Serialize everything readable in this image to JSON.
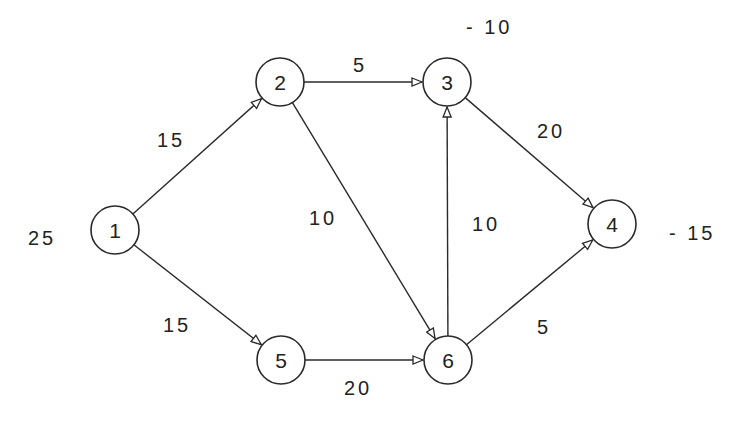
{
  "diagram": {
    "type": "directed-network-flow",
    "stroke_color": "#2a2a2a",
    "background": "#ffffff",
    "nodes": [
      {
        "id": "1",
        "label": "1",
        "x": 115,
        "y": 230,
        "supply": "25",
        "supply_x": 28,
        "supply_y": 245
      },
      {
        "id": "2",
        "label": "2",
        "x": 280,
        "y": 82,
        "supply": "",
        "supply_x": 0,
        "supply_y": 0
      },
      {
        "id": "3",
        "label": "3",
        "x": 447,
        "y": 82,
        "supply": "-10",
        "supply_x": 466,
        "supply_y": 34
      },
      {
        "id": "4",
        "label": "4",
        "x": 612,
        "y": 224,
        "supply": "-15",
        "supply_x": 669,
        "supply_y": 240
      },
      {
        "id": "5",
        "label": "5",
        "x": 281,
        "y": 360,
        "supply": "",
        "supply_x": 0,
        "supply_y": 0
      },
      {
        "id": "6",
        "label": "6",
        "x": 448,
        "y": 360,
        "supply": "",
        "supply_x": 0,
        "supply_y": 0
      }
    ],
    "node_radius": 24,
    "edges": [
      {
        "from": "1",
        "to": "2",
        "label": "15",
        "label_x": 157,
        "label_y": 147
      },
      {
        "from": "1",
        "to": "5",
        "label": "15",
        "label_x": 163,
        "label_y": 332
      },
      {
        "from": "2",
        "to": "3",
        "label": "5",
        "label_x": 353,
        "label_y": 72
      },
      {
        "from": "2",
        "to": "6",
        "label": "10",
        "label_x": 309,
        "label_y": 225
      },
      {
        "from": "6",
        "to": "3",
        "label": "10",
        "label_x": 472,
        "label_y": 231
      },
      {
        "from": "3",
        "to": "4",
        "label": "20",
        "label_x": 537,
        "label_y": 138
      },
      {
        "from": "5",
        "to": "6",
        "label": "20",
        "label_x": 344,
        "label_y": 395
      },
      {
        "from": "6",
        "to": "4",
        "label": "5",
        "label_x": 537,
        "label_y": 334
      }
    ]
  }
}
